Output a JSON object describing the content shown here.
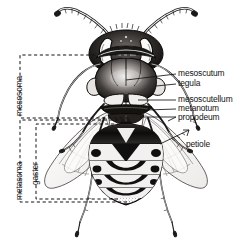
{
  "figure": {
    "background_color": "#ffffff",
    "ink_color": "#111111"
  },
  "labels": {
    "mesoscutum": "mesoscutum",
    "tegula": "tegula",
    "mesoscutellum": "mesoscutellum",
    "metanotum": "metanotum",
    "propodeum": "propodeum",
    "petiole": "petiole"
  },
  "bracket_labels": {
    "mesosoma": "mesosoma",
    "metasoma": "metasoma",
    "gaster": "gaster"
  },
  "anatomy_parts": [
    "antenna",
    "compound-eye",
    "ocelli",
    "head",
    "mandible",
    "mesoscutum",
    "tegula",
    "mesoscutellum",
    "metanotum",
    "propodeum",
    "petiole",
    "gaster",
    "forewing",
    "hindwing",
    "foreleg",
    "midleg",
    "hindleg"
  ]
}
